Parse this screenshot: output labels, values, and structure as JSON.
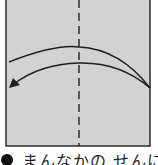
{
  "diagram": {
    "paper_color": "#d2d2d2",
    "border_color": "#2a2a2a",
    "line_color": "#1e1e1e",
    "fold_line": "dashed-vertical-center",
    "arrow": "curved-arrow-right-to-left"
  },
  "caption": {
    "bullet": "●",
    "text": "まんなかの せんに"
  }
}
